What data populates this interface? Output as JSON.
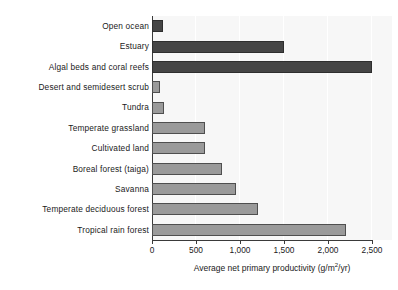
{
  "chart_data": {
    "type": "bar",
    "orientation": "horizontal",
    "title": "",
    "xlabel": "Average net primary productivity (g/m2/yr)",
    "xlabel_prefix": "Average net primary productivity (g/m",
    "xlabel_sup": "2",
    "xlabel_suffix": "/yr)",
    "ylabel": "",
    "xlim": [
      0,
      2600
    ],
    "xticks": [
      0,
      500,
      1000,
      1500,
      2000,
      2500
    ],
    "xtick_labels": [
      "0",
      "500",
      "1,000",
      "1,500",
      "2,000",
      "2,500"
    ],
    "grid": "vertical-faint",
    "legend": "none",
    "categories": [
      "Open ocean",
      "Estuary",
      "Algal beds and coral reefs",
      "Desert and semidesert scrub",
      "Tundra",
      "Temperate grassland",
      "Cultivated land",
      "Boreal forest (taiga)",
      "Savanna",
      "Temperate deciduous forest",
      "Tropical rain forest"
    ],
    "values": [
      125,
      1500,
      2500,
      90,
      140,
      600,
      600,
      800,
      950,
      1200,
      2200
    ],
    "bar_shades": [
      "dark",
      "dark",
      "dark",
      "light",
      "light",
      "light",
      "light",
      "light",
      "light",
      "light",
      "light"
    ],
    "colors": {
      "dark_bar": "#454545",
      "light_bar": "#9a9a9a",
      "bar_outline": "#4a4a4a",
      "axis": "#3a3a3a",
      "plot_background": "#f7f7f7",
      "page_background": "#ffffff",
      "text": "#1a1a1a"
    }
  }
}
